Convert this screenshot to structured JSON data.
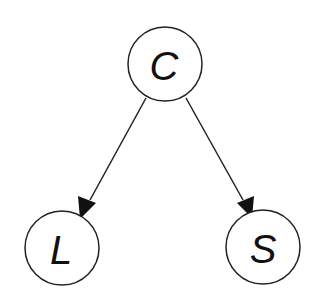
{
  "diagram": {
    "type": "directed-graph",
    "nodes": [
      {
        "id": "C",
        "label": "C"
      },
      {
        "id": "L",
        "label": "L"
      },
      {
        "id": "S",
        "label": "S"
      }
    ],
    "edges": [
      {
        "from": "C",
        "to": "L"
      },
      {
        "from": "C",
        "to": "S"
      }
    ]
  }
}
